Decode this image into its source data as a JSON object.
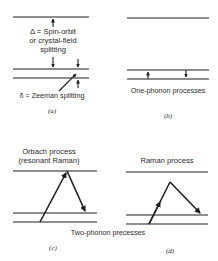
{
  "panels": {
    "a": {
      "caption": "(a)",
      "delta_label_line1": "Δ = Spin-orbit",
      "delta_label_line2": "or crystal-field",
      "delta_label_line3": "splitting",
      "zeeman_label": "δ = Zeeman splitting"
    },
    "b": {
      "caption": "(b)",
      "title": "One-phonon processes"
    },
    "c": {
      "caption": "(c)",
      "title_line1": "Orbach process",
      "title_line2": "(resonant Raman)"
    },
    "d": {
      "caption": "(d)",
      "title": "Raman process"
    }
  },
  "shared_label": "Two-phonon precesses",
  "colors": {
    "ink": "#1e1e1e",
    "background": "#ffffff"
  }
}
